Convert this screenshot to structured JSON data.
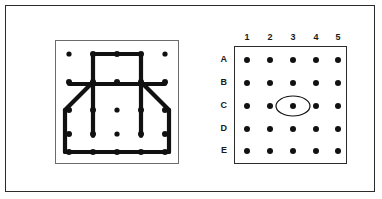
{
  "figure": {
    "type": "geoboard-puzzle",
    "panels": 2,
    "background_color": "#ffffff",
    "ink_color": "#111111",
    "frame_color": "#2b2b2b"
  },
  "left_panel": {
    "name": "geoboard-with-rubber-band-figure",
    "frame_color": "#6b6b6b",
    "peg_rows": 5,
    "peg_cols": 5,
    "peg_color": "#111111",
    "band_color": "#111111",
    "band_width": 4,
    "pegs": [
      {
        "id": "A1",
        "row": "A",
        "col": 1,
        "x": 14,
        "y": 14,
        "on_band": false
      },
      {
        "id": "A2",
        "row": "A",
        "col": 2,
        "x": 38,
        "y": 14,
        "on_band": true
      },
      {
        "id": "A3",
        "row": "A",
        "col": 3,
        "x": 62,
        "y": 14,
        "on_band": true
      },
      {
        "id": "A4",
        "row": "A",
        "col": 4,
        "x": 86,
        "y": 14,
        "on_band": true
      },
      {
        "id": "A5",
        "row": "A",
        "col": 5,
        "x": 110,
        "y": 14,
        "on_band": false
      },
      {
        "id": "B1",
        "row": "B",
        "col": 1,
        "x": 14,
        "y": 42,
        "on_band": true
      },
      {
        "id": "B2",
        "row": "B",
        "col": 2,
        "x": 38,
        "y": 42,
        "on_band": true
      },
      {
        "id": "B3",
        "row": "B",
        "col": 3,
        "x": 62,
        "y": 42,
        "on_band": true
      },
      {
        "id": "B4",
        "row": "B",
        "col": 4,
        "x": 86,
        "y": 42,
        "on_band": true
      },
      {
        "id": "B5",
        "row": "B",
        "col": 5,
        "x": 110,
        "y": 42,
        "on_band": true
      },
      {
        "id": "C1",
        "row": "C",
        "col": 1,
        "x": 14,
        "y": 70,
        "on_band": true
      },
      {
        "id": "C2",
        "row": "C",
        "col": 2,
        "x": 38,
        "y": 70,
        "on_band": true
      },
      {
        "id": "C3",
        "row": "C",
        "col": 3,
        "x": 62,
        "y": 70,
        "on_band": false
      },
      {
        "id": "C4",
        "row": "C",
        "col": 4,
        "x": 86,
        "y": 70,
        "on_band": true
      },
      {
        "id": "C5",
        "row": "C",
        "col": 5,
        "x": 110,
        "y": 70,
        "on_band": true
      },
      {
        "id": "D1",
        "row": "D",
        "col": 1,
        "x": 14,
        "y": 94,
        "on_band": true
      },
      {
        "id": "D2",
        "row": "D",
        "col": 2,
        "x": 38,
        "y": 94,
        "on_band": true
      },
      {
        "id": "D3",
        "row": "D",
        "col": 3,
        "x": 62,
        "y": 94,
        "on_band": false
      },
      {
        "id": "D4",
        "row": "D",
        "col": 4,
        "x": 86,
        "y": 94,
        "on_band": true
      },
      {
        "id": "D5",
        "row": "D",
        "col": 5,
        "x": 110,
        "y": 94,
        "on_band": true
      },
      {
        "id": "E1",
        "row": "E",
        "col": 1,
        "x": 14,
        "y": 112,
        "on_band": true
      },
      {
        "id": "E2",
        "row": "E",
        "col": 2,
        "x": 38,
        "y": 112,
        "on_band": true
      },
      {
        "id": "E3",
        "row": "E",
        "col": 3,
        "x": 62,
        "y": 112,
        "on_band": true
      },
      {
        "id": "E4",
        "row": "E",
        "col": 4,
        "x": 86,
        "y": 112,
        "on_band": true
      },
      {
        "id": "E5",
        "row": "E",
        "col": 5,
        "x": 110,
        "y": 112,
        "on_band": true
      }
    ],
    "band_segments": [
      {
        "name": "top-rect-left-side",
        "points": "38,14 38,42"
      },
      {
        "name": "top-rect-top-side",
        "points": "38,14 86,14"
      },
      {
        "name": "top-rect-right-side",
        "points": "86,14 86,42"
      },
      {
        "name": "horizontal-crossbar",
        "points": "14,44 110,44"
      },
      {
        "name": "left-diagonal-shoulder",
        "points": "38,42 10,70"
      },
      {
        "name": "right-diagonal-shoulder",
        "points": "86,42 114,70"
      },
      {
        "name": "left-outer-wall",
        "points": "10,70 10,112"
      },
      {
        "name": "right-outer-wall",
        "points": "114,70 114,112"
      },
      {
        "name": "bottom-edge",
        "points": "10,112 114,112"
      },
      {
        "name": "inner-left-stem",
        "points": "38,44 38,96"
      },
      {
        "name": "inner-right-stem",
        "points": "86,44 86,96"
      }
    ]
  },
  "right_panel": {
    "name": "coordinate-grid",
    "frame_color": "#2b2b2b",
    "dot_color": "#111111",
    "column_labels": [
      "1",
      "2",
      "3",
      "4",
      "5"
    ],
    "row_labels": [
      "A",
      "B",
      "C",
      "D",
      "E"
    ],
    "dot_spacing_x": 22,
    "dot_spacing_y": 22,
    "dots": [
      {
        "id": "A1",
        "row": "A",
        "col": "1",
        "x": 13,
        "y": 14,
        "highlighted": false
      },
      {
        "id": "A2",
        "row": "A",
        "col": "2",
        "x": 36,
        "y": 14,
        "highlighted": false
      },
      {
        "id": "A3",
        "row": "A",
        "col": "3",
        "x": 59,
        "y": 14,
        "highlighted": false
      },
      {
        "id": "A4",
        "row": "A",
        "col": "4",
        "x": 82,
        "y": 14,
        "highlighted": false
      },
      {
        "id": "A5",
        "row": "A",
        "col": "5",
        "x": 104,
        "y": 14,
        "highlighted": false
      },
      {
        "id": "B1",
        "row": "B",
        "col": "1",
        "x": 13,
        "y": 37,
        "highlighted": false
      },
      {
        "id": "B2",
        "row": "B",
        "col": "2",
        "x": 36,
        "y": 37,
        "highlighted": false
      },
      {
        "id": "B3",
        "row": "B",
        "col": "3",
        "x": 59,
        "y": 37,
        "highlighted": false
      },
      {
        "id": "B4",
        "row": "B",
        "col": "4",
        "x": 82,
        "y": 37,
        "highlighted": false
      },
      {
        "id": "B5",
        "row": "B",
        "col": "5",
        "x": 104,
        "y": 37,
        "highlighted": false
      },
      {
        "id": "C1",
        "row": "C",
        "col": "1",
        "x": 13,
        "y": 60,
        "highlighted": false
      },
      {
        "id": "C2",
        "row": "C",
        "col": "2",
        "x": 36,
        "y": 60,
        "highlighted": false
      },
      {
        "id": "C3",
        "row": "C",
        "col": "3",
        "x": 59,
        "y": 60,
        "highlighted": true
      },
      {
        "id": "C4",
        "row": "C",
        "col": "4",
        "x": 82,
        "y": 60,
        "highlighted": false
      },
      {
        "id": "C5",
        "row": "C",
        "col": "5",
        "x": 104,
        "y": 60,
        "highlighted": false
      },
      {
        "id": "D1",
        "row": "D",
        "col": "1",
        "x": 13,
        "y": 83,
        "highlighted": false
      },
      {
        "id": "D2",
        "row": "D",
        "col": "2",
        "x": 36,
        "y": 83,
        "highlighted": false
      },
      {
        "id": "D3",
        "row": "D",
        "col": "3",
        "x": 59,
        "y": 83,
        "highlighted": false
      },
      {
        "id": "D4",
        "row": "D",
        "col": "4",
        "x": 82,
        "y": 83,
        "highlighted": false
      },
      {
        "id": "D5",
        "row": "D",
        "col": "5",
        "x": 104,
        "y": 83,
        "highlighted": false
      },
      {
        "id": "E1",
        "row": "E",
        "col": "1",
        "x": 13,
        "y": 105,
        "highlighted": false
      },
      {
        "id": "E2",
        "row": "E",
        "col": "2",
        "x": 36,
        "y": 105,
        "highlighted": false
      },
      {
        "id": "E3",
        "row": "E",
        "col": "3",
        "x": 59,
        "y": 105,
        "highlighted": false
      },
      {
        "id": "E4",
        "row": "E",
        "col": "4",
        "x": 82,
        "y": 105,
        "highlighted": false
      },
      {
        "id": "E5",
        "row": "E",
        "col": "5",
        "x": 104,
        "y": 105,
        "highlighted": false
      }
    ],
    "highlight": {
      "target_dot": "C3",
      "shape": "ellipse",
      "rx": 17,
      "ry": 10,
      "stroke_color": "#111111",
      "stroke_width": 1.2,
      "fill": "none"
    }
  }
}
